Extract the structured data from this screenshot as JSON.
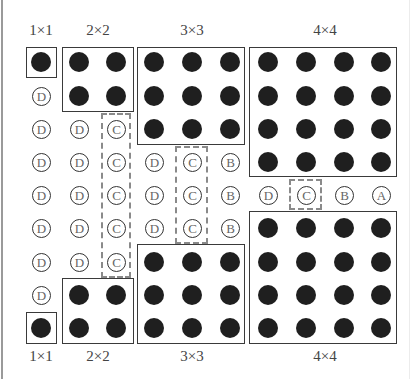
{
  "grid": {
    "col_x": [
      41,
      79,
      116,
      154,
      192,
      230,
      268,
      306,
      344,
      381
    ],
    "row_y": [
      62,
      96,
      129,
      162,
      195,
      228,
      262,
      295,
      328
    ]
  },
  "colors": {
    "dot": "#1f1f1f",
    "box": "#3a3a3a",
    "dashed": "#8a8a8a",
    "letter": "#666666"
  },
  "top_labels": [
    {
      "text": "1×1",
      "x": 41
    },
    {
      "text": "2×2",
      "x": 98
    },
    {
      "text": "3×3",
      "x": 192
    },
    {
      "text": "4×4",
      "x": 325
    }
  ],
  "bottom_labels": [
    {
      "text": "1×1",
      "x": 41
    },
    {
      "text": "2×2",
      "x": 98
    },
    {
      "text": "3×3",
      "x": 192
    },
    {
      "text": "4×4",
      "x": 325
    }
  ],
  "solid_boxes": [
    {
      "name": "box-1x1-top",
      "x": 26,
      "y": 47,
      "w": 31,
      "h": 31
    },
    {
      "name": "box-2x2-top",
      "x": 62,
      "y": 47,
      "w": 72,
      "h": 65
    },
    {
      "name": "box-3x3-top",
      "x": 137,
      "y": 47,
      "w": 108,
      "h": 98
    },
    {
      "name": "box-4x4-top",
      "x": 249,
      "y": 47,
      "w": 148,
      "h": 130
    },
    {
      "name": "box-4x4-bottom",
      "x": 249,
      "y": 211,
      "w": 148,
      "h": 133
    },
    {
      "name": "box-3x3-bottom",
      "x": 137,
      "y": 244,
      "w": 108,
      "h": 100
    },
    {
      "name": "box-2x2-bottom",
      "x": 62,
      "y": 278,
      "w": 72,
      "h": 66
    },
    {
      "name": "box-1x1-bottom",
      "x": 26,
      "y": 312,
      "w": 31,
      "h": 32
    }
  ],
  "dashed_boxes": [
    {
      "name": "dashed-c-col3",
      "x": 101,
      "y": 113,
      "w": 30,
      "h": 165
    },
    {
      "name": "dashed-c-col5",
      "x": 175,
      "y": 146,
      "w": 33,
      "h": 98
    },
    {
      "name": "dashed-c-center",
      "x": 289,
      "y": 179,
      "w": 33,
      "h": 31
    }
  ],
  "dots": [
    [
      0,
      0
    ],
    [
      1,
      0
    ],
    [
      2,
      0
    ],
    [
      1,
      1
    ],
    [
      2,
      1
    ],
    [
      3,
      0
    ],
    [
      4,
      0
    ],
    [
      5,
      0
    ],
    [
      3,
      1
    ],
    [
      4,
      1
    ],
    [
      5,
      1
    ],
    [
      3,
      2
    ],
    [
      4,
      2
    ],
    [
      5,
      2
    ],
    [
      6,
      0
    ],
    [
      7,
      0
    ],
    [
      8,
      0
    ],
    [
      9,
      0
    ],
    [
      6,
      1
    ],
    [
      7,
      1
    ],
    [
      8,
      1
    ],
    [
      9,
      1
    ],
    [
      6,
      2
    ],
    [
      7,
      2
    ],
    [
      8,
      2
    ],
    [
      9,
      2
    ],
    [
      6,
      3
    ],
    [
      7,
      3
    ],
    [
      8,
      3
    ],
    [
      9,
      3
    ],
    [
      6,
      5
    ],
    [
      7,
      5
    ],
    [
      8,
      5
    ],
    [
      9,
      5
    ],
    [
      6,
      6
    ],
    [
      7,
      6
    ],
    [
      8,
      6
    ],
    [
      9,
      6
    ],
    [
      6,
      7
    ],
    [
      7,
      7
    ],
    [
      8,
      7
    ],
    [
      9,
      7
    ],
    [
      6,
      8
    ],
    [
      7,
      8
    ],
    [
      8,
      8
    ],
    [
      9,
      8
    ],
    [
      3,
      6
    ],
    [
      4,
      6
    ],
    [
      5,
      6
    ],
    [
      3,
      7
    ],
    [
      4,
      7
    ],
    [
      5,
      7
    ],
    [
      3,
      8
    ],
    [
      4,
      8
    ],
    [
      5,
      8
    ],
    [
      1,
      7
    ],
    [
      2,
      7
    ],
    [
      1,
      8
    ],
    [
      2,
      8
    ],
    [
      0,
      8
    ]
  ],
  "letters": [
    {
      "c": 0,
      "r": 1,
      "t": "D"
    },
    {
      "c": 0,
      "r": 2,
      "t": "D"
    },
    {
      "c": 1,
      "r": 2,
      "t": "D"
    },
    {
      "c": 2,
      "r": 2,
      "t": "C"
    },
    {
      "c": 0,
      "r": 3,
      "t": "D"
    },
    {
      "c": 1,
      "r": 3,
      "t": "D"
    },
    {
      "c": 2,
      "r": 3,
      "t": "C"
    },
    {
      "c": 3,
      "r": 3,
      "t": "D"
    },
    {
      "c": 4,
      "r": 3,
      "t": "C"
    },
    {
      "c": 5,
      "r": 3,
      "t": "B"
    },
    {
      "c": 0,
      "r": 4,
      "t": "D"
    },
    {
      "c": 1,
      "r": 4,
      "t": "D"
    },
    {
      "c": 2,
      "r": 4,
      "t": "C"
    },
    {
      "c": 3,
      "r": 4,
      "t": "D"
    },
    {
      "c": 4,
      "r": 4,
      "t": "C"
    },
    {
      "c": 5,
      "r": 4,
      "t": "B"
    },
    {
      "c": 6,
      "r": 4,
      "t": "D"
    },
    {
      "c": 7,
      "r": 4,
      "t": "C"
    },
    {
      "c": 8,
      "r": 4,
      "t": "B"
    },
    {
      "c": 9,
      "r": 4,
      "t": "A"
    },
    {
      "c": 0,
      "r": 5,
      "t": "D"
    },
    {
      "c": 1,
      "r": 5,
      "t": "D"
    },
    {
      "c": 2,
      "r": 5,
      "t": "C"
    },
    {
      "c": 3,
      "r": 5,
      "t": "D"
    },
    {
      "c": 4,
      "r": 5,
      "t": "C"
    },
    {
      "c": 5,
      "r": 5,
      "t": "B"
    },
    {
      "c": 0,
      "r": 6,
      "t": "D"
    },
    {
      "c": 1,
      "r": 6,
      "t": "D"
    },
    {
      "c": 2,
      "r": 6,
      "t": "C"
    },
    {
      "c": 0,
      "r": 7,
      "t": "D"
    }
  ]
}
